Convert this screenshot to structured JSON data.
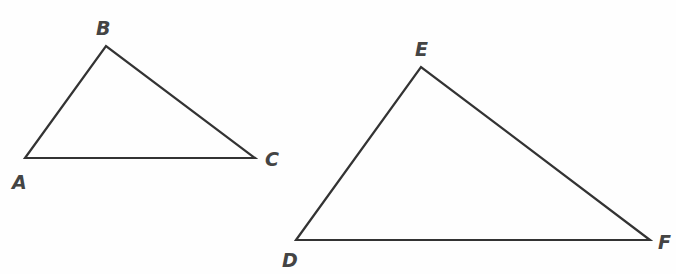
{
  "diagram": {
    "stroke_color": "#333333",
    "label_color": "#444444",
    "triangles": [
      {
        "name": "ABC",
        "vertices": [
          {
            "label": "A",
            "x": 25,
            "y": 158,
            "lx": 12,
            "ly": 173
          },
          {
            "label": "B",
            "x": 106,
            "y": 46,
            "lx": 96,
            "ly": 19
          },
          {
            "label": "C",
            "x": 255,
            "y": 158,
            "lx": 265,
            "ly": 150
          }
        ]
      },
      {
        "name": "DEF",
        "vertices": [
          {
            "label": "D",
            "x": 296,
            "y": 240,
            "lx": 282,
            "ly": 251
          },
          {
            "label": "E",
            "x": 421,
            "y": 67,
            "lx": 415,
            "ly": 40
          },
          {
            "label": "F",
            "x": 650,
            "y": 240,
            "lx": 658,
            "ly": 233
          }
        ]
      }
    ]
  }
}
